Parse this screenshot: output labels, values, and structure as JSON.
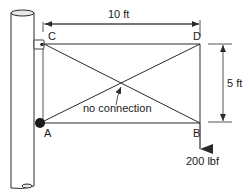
{
  "diagram": {
    "type": "truss frame attached to pole",
    "nodes": {
      "A": {
        "label": "A",
        "support": "pinned (solid dot)"
      },
      "B": {
        "label": "B"
      },
      "C": {
        "label": "C",
        "support": "pin in bracket"
      },
      "D": {
        "label": "D"
      }
    },
    "members": [
      "C-D",
      "A-B",
      "D-B",
      "A-C",
      "C-B",
      "A-D"
    ],
    "dimensions": {
      "horizontal": "10 ft",
      "vertical": "5 ft"
    },
    "annotation": "no connection",
    "load": {
      "node": "B",
      "value": "200 lbf",
      "direction": "down"
    },
    "colors": {
      "line": "#2a2a2a",
      "background": "#ffffff"
    }
  }
}
